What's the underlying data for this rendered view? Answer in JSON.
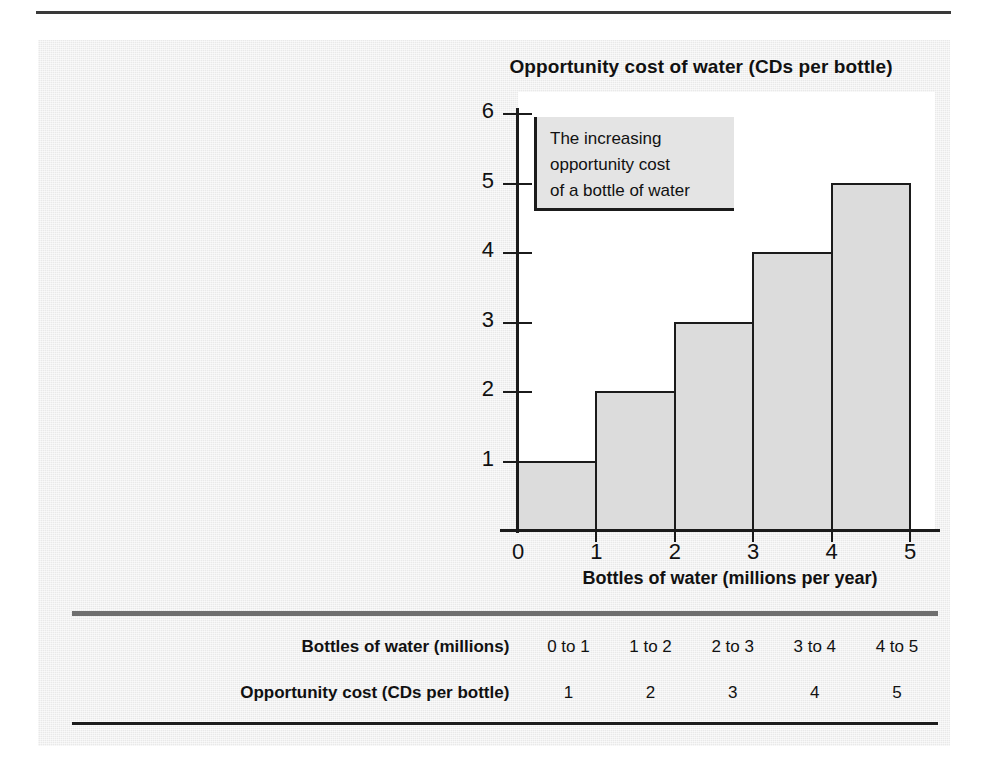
{
  "page": {
    "rule_visible": true
  },
  "chart": {
    "title": "Opportunity cost of water (CDs per bottle)",
    "x_axis_caption": "Bottles of water (millions per year)",
    "y_tick_labels": [
      "6",
      "5",
      "4",
      "3",
      "2",
      "1"
    ],
    "x_tick_labels": [
      "0",
      "1",
      "2",
      "3",
      "4",
      "5"
    ],
    "annotation": {
      "line1": "The increasing",
      "line2": "opportunity cost",
      "line3": "of a bottle of water"
    },
    "colors": {
      "bar_fill": "#dcdcdc",
      "bar_stroke": "#1b1b1b",
      "plot_background": "#ffffff",
      "panel_background": "#e9e9e9",
      "rule": "#6f6f6f"
    }
  },
  "table": {
    "rows": [
      {
        "label": "Bottles of water (millions)",
        "cells": [
          "0 to 1",
          "1 to 2",
          "2 to 3",
          "3 to 4",
          "4 to 5"
        ]
      },
      {
        "label": "Opportunity cost (CDs per bottle)",
        "cells": [
          "1",
          "2",
          "3",
          "4",
          "5"
        ]
      }
    ]
  },
  "chart_data": {
    "type": "bar",
    "title": "Opportunity cost of water (CDs per bottle)",
    "xlabel": "Bottles of water (millions per year)",
    "ylabel": "Opportunity cost of water (CDs per bottle)",
    "categories": [
      "0 to 1",
      "1 to 2",
      "2 to 3",
      "3 to 4",
      "4 to 5"
    ],
    "values": [
      1,
      2,
      3,
      4,
      5
    ],
    "x": [
      0,
      1,
      2,
      3,
      4,
      5
    ],
    "xlim": [
      0,
      5
    ],
    "ylim": [
      0,
      6
    ],
    "xticks": [
      0,
      1,
      2,
      3,
      4,
      5
    ],
    "yticks": [
      1,
      2,
      3,
      4,
      5,
      6
    ],
    "grid": false,
    "legend": false,
    "annotations": [
      "The increasing opportunity cost of a bottle of water"
    ]
  }
}
